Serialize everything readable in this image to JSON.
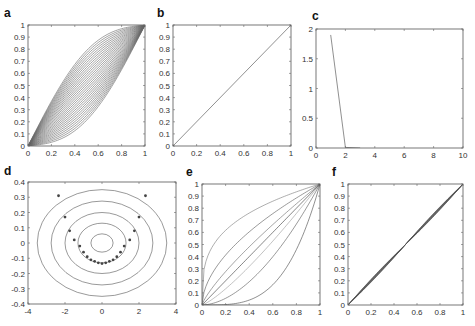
{
  "figure": {
    "width": 475,
    "height": 326,
    "line_color": "#555555",
    "marker_color": "#444444"
  },
  "chart_data": [
    {
      "id": "a",
      "label": "a",
      "type": "line",
      "title": "",
      "xlabel": "",
      "ylabel": "",
      "xlim": [
        0,
        1
      ],
      "ylim": [
        0,
        1
      ],
      "xticks": [
        0,
        0.2,
        0.4,
        0.6,
        0.8,
        1
      ],
      "xtick_labels": [
        "0",
        "0.2",
        "0.4",
        "0.6",
        "0.8",
        "1"
      ],
      "yticks": [
        0,
        0.1,
        0.2,
        0.3,
        0.4,
        0.5,
        0.6,
        0.7,
        0.8,
        0.9,
        1
      ],
      "ytick_labels": [
        "0",
        "0.1",
        "0.2",
        "0.3",
        "0.4",
        "0.5",
        "0.6",
        "0.7",
        "0.8",
        "0.9",
        "1"
      ],
      "grid": false,
      "description": "Family of ~30 monotone curves from (0,0) to (1,1), ranging from concave (upper) to convex (lower), densely packed sigmoid-like fan",
      "series_family": {
        "count": 30,
        "kind": "fan",
        "min_exponent": 0.5,
        "max_exponent": 2.0,
        "mix": "sigmoid"
      }
    },
    {
      "id": "b",
      "label": "b",
      "type": "line",
      "xlim": [
        0,
        1
      ],
      "ylim": [
        0,
        1
      ],
      "xticks": [
        0,
        0.2,
        0.4,
        0.6,
        0.8,
        1
      ],
      "xtick_labels": [
        "0",
        "0.2",
        "0.4",
        "0.6",
        "0.8",
        "1"
      ],
      "yticks": [
        0,
        0.1,
        0.2,
        0.3,
        0.4,
        0.5,
        0.6,
        0.7,
        0.8,
        0.9,
        1
      ],
      "ytick_labels": [
        "0",
        "0.1",
        "0.2",
        "0.3",
        "0.4",
        "0.5",
        "0.6",
        "0.7",
        "0.8",
        "0.9",
        "1"
      ],
      "grid": false,
      "series": [
        {
          "name": "identity",
          "x": [
            0,
            1
          ],
          "y": [
            0,
            1
          ]
        }
      ]
    },
    {
      "id": "c",
      "label": "c",
      "type": "line",
      "xlim": [
        0,
        10
      ],
      "ylim": [
        0,
        2
      ],
      "xticks": [
        0,
        2,
        4,
        6,
        8,
        10
      ],
      "xtick_labels": [
        "0",
        "2",
        "4",
        "6",
        "8",
        "10"
      ],
      "yticks": [
        0,
        0.5,
        1,
        1.5,
        2
      ],
      "ytick_labels": [
        "0",
        "0.5",
        "1",
        "1.5",
        "2"
      ],
      "grid": false,
      "series": [
        {
          "name": "error",
          "x": [
            1,
            2,
            3
          ],
          "y": [
            1.9,
            0.01,
            0.0
          ]
        }
      ]
    },
    {
      "id": "d",
      "label": "d",
      "type": "scatter",
      "xlim": [
        -4,
        4
      ],
      "ylim": [
        -0.4,
        0.4
      ],
      "xticks": [
        -4,
        -2,
        0,
        2,
        4
      ],
      "xtick_labels": [
        "-4",
        "-2",
        "0",
        "2",
        "4"
      ],
      "yticks": [
        -0.4,
        -0.3,
        -0.2,
        -0.1,
        0,
        0.1,
        0.2,
        0.3,
        0.4
      ],
      "ytick_labels": [
        "-0.4",
        "-0.3",
        "-0.2",
        "-0.1",
        "0",
        "0.1",
        "0.2",
        "0.3",
        "0.4"
      ],
      "grid": false,
      "contours": [
        {
          "rx": 0.6,
          "ry": 0.06
        },
        {
          "rx": 1.3,
          "ry": 0.13
        },
        {
          "rx": 2.0,
          "ry": 0.2
        },
        {
          "rx": 2.75,
          "ry": 0.275
        },
        {
          "rx": 3.5,
          "ry": 0.35
        }
      ],
      "points": {
        "x": [
          -2.35,
          -2.0,
          -1.75,
          -1.5,
          -1.2,
          -1.0,
          -0.8,
          -0.6,
          -0.4,
          -0.2,
          0.0,
          0.2,
          0.4,
          0.6,
          0.8,
          1.0,
          1.2,
          1.5,
          1.75,
          2.0,
          2.35
        ],
        "y": [
          0.31,
          0.17,
          0.08,
          0.02,
          -0.02,
          -0.06,
          -0.09,
          -0.11,
          -0.12,
          -0.13,
          -0.135,
          -0.13,
          -0.12,
          -0.11,
          -0.09,
          -0.06,
          -0.02,
          0.02,
          0.08,
          0.17,
          0.31
        ]
      }
    },
    {
      "id": "e",
      "label": "e",
      "type": "line",
      "xlim": [
        0,
        1
      ],
      "ylim": [
        0,
        1
      ],
      "xticks": [
        0,
        0.2,
        0.4,
        0.6,
        0.8,
        1
      ],
      "xtick_labels": [
        "0",
        "0.2",
        "0.4",
        "0.6",
        "0.8",
        "1"
      ],
      "yticks": [
        0,
        0.1,
        0.2,
        0.3,
        0.4,
        0.5,
        0.6,
        0.7,
        0.8,
        0.9,
        1
      ],
      "ytick_labels": [
        "0",
        "0.1",
        "0.2",
        "0.3",
        "0.4",
        "0.5",
        "0.6",
        "0.7",
        "0.8",
        "0.9",
        "1"
      ],
      "grid": false,
      "series": [
        {
          "name": "p0.3",
          "exponent": 0.3,
          "color": "#777777"
        },
        {
          "name": "p0.55",
          "exponent": 0.55,
          "color": "#555555"
        },
        {
          "name": "p0.8",
          "exponent": 0.8,
          "color": "#666666"
        },
        {
          "name": "p1.0",
          "exponent": 1.0,
          "color": "#333333"
        },
        {
          "name": "p1.25",
          "exponent": 1.25,
          "color": "#999999"
        },
        {
          "name": "p1.8",
          "exponent": 1.8,
          "color": "#555555"
        },
        {
          "name": "p3.5",
          "exponent": 3.5,
          "color": "#444444"
        }
      ]
    },
    {
      "id": "f",
      "label": "f",
      "type": "line",
      "xlim": [
        0,
        1
      ],
      "ylim": [
        0,
        1
      ],
      "xticks": [
        0,
        0.2,
        0.4,
        0.6,
        0.8,
        1
      ],
      "xtick_labels": [
        "0",
        "0.2",
        "0.4",
        "0.6",
        "0.8",
        "1"
      ],
      "yticks": [
        0,
        0.1,
        0.2,
        0.3,
        0.4,
        0.5,
        0.6,
        0.7,
        0.8,
        0.9,
        1
      ],
      "ytick_labels": [
        "0",
        "0.1",
        "0.2",
        "0.3",
        "0.4",
        "0.5",
        "0.6",
        "0.7",
        "0.8",
        "0.9",
        "1"
      ],
      "grid": false,
      "description": "Bundle of nearly identical curves close to y=x, slightly spread around 0.2 and 0.8, pinched at 0.5",
      "series_family": {
        "count": 10,
        "kind": "near-identity",
        "spread": 0.012
      }
    }
  ],
  "layout": {
    "panels": {
      "a": {
        "x": 28,
        "y": 25,
        "w": 117,
        "h": 121,
        "label_x": 4,
        "label_y": 17
      },
      "b": {
        "x": 173,
        "y": 25,
        "w": 118,
        "h": 121,
        "label_x": 157,
        "label_y": 17
      },
      "c": {
        "x": 316,
        "y": 29,
        "w": 147,
        "h": 119,
        "label_x": 312,
        "label_y": 20
      },
      "d": {
        "x": 28,
        "y": 182,
        "w": 148,
        "h": 122,
        "label_x": 4,
        "label_y": 175
      },
      "e": {
        "x": 202,
        "y": 184,
        "w": 118,
        "h": 121,
        "label_x": 186,
        "label_y": 176
      },
      "f": {
        "x": 348,
        "y": 184,
        "w": 115,
        "h": 121,
        "label_x": 332,
        "label_y": 176
      }
    }
  }
}
